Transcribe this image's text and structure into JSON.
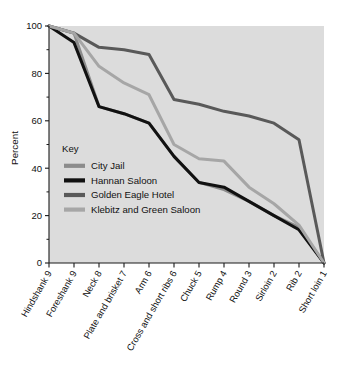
{
  "chart_data": {
    "type": "line",
    "title": "",
    "xlabel": "",
    "ylabel": "Percent",
    "ylim": [
      0,
      100
    ],
    "yticks": [
      0,
      20,
      40,
      60,
      80,
      100
    ],
    "ytick_labels": [
      "0",
      "20",
      "40",
      "60",
      "80",
      "100"
    ],
    "minor_yticks": [
      10,
      30,
      50,
      70,
      90
    ],
    "grid": false,
    "legend_position": "inside-left",
    "legend_title": "Key",
    "categories": [
      "Hindshank 9",
      "Foreshank 9",
      "Neck 8",
      "Plate and brisket 7",
      "Arm 6",
      "Cross and short ribs 6",
      "Chuck 5",
      "Rump 4",
      "Round 3",
      "Sirloin 2",
      "Rib 2",
      "Short loin 1"
    ],
    "series": [
      {
        "name": "City Jail",
        "color": "#8c8c8c",
        "values": [
          100,
          97,
          66,
          63,
          59,
          45,
          34,
          31,
          26,
          20,
          15,
          0
        ]
      },
      {
        "name": "Hannan Saloon",
        "color": "#111111",
        "values": [
          100,
          93,
          66,
          63,
          59,
          45,
          34,
          32,
          26,
          20,
          14,
          0
        ]
      },
      {
        "name": "Golden Eagle Hotel",
        "color": "#595959",
        "values": [
          100,
          97,
          91,
          90,
          88,
          69,
          67,
          64,
          62,
          59,
          52,
          0
        ]
      },
      {
        "name": "Klebitz and Green Saloon",
        "color": "#a6a6a6",
        "values": [
          100,
          97,
          83,
          76,
          71,
          50,
          44,
          43,
          32,
          25,
          16,
          0
        ]
      }
    ]
  },
  "legend": {
    "title": "Key",
    "entries": [
      {
        "label": "City Jail",
        "color": "#8c8c8c"
      },
      {
        "label": "Hannan Saloon",
        "color": "#111111"
      },
      {
        "label": "Golden Eagle Hotel",
        "color": "#595959"
      },
      {
        "label": "Klebitz and Green Saloon",
        "color": "#a6a6a6"
      }
    ]
  },
  "axes": {
    "y_title": "Percent"
  }
}
